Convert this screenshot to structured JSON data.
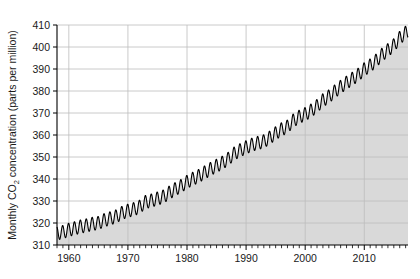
{
  "chart_data": {
    "type": "line",
    "title": "",
    "subtitle": "",
    "xlabel": "",
    "ylabel": "Monthly CO₂ concentration (parts per million)",
    "ylabel_parts": {
      "pre": "Monthly CO",
      "sub": "2",
      "post": " concentration (parts per million)"
    },
    "xlim": [
      1958.0,
      2017.4
    ],
    "ylim": [
      310,
      410
    ],
    "y_ticks": [
      310,
      320,
      330,
      340,
      350,
      360,
      370,
      380,
      390,
      400,
      410
    ],
    "y_tick_labels": [
      "310",
      "320",
      "330",
      "340",
      "350",
      "360",
      "370",
      "380",
      "390",
      "400",
      "410"
    ],
    "x_ticks": [
      1960,
      1970,
      1980,
      1990,
      2000,
      2010
    ],
    "x_tick_labels": [
      "1960",
      "1970",
      "1980",
      "1990",
      "2000",
      "2010"
    ],
    "x_minor_tick_interval": 1,
    "grid": {
      "horizontal": true,
      "vertical": true,
      "color": "#bdbdbd"
    },
    "legend": {
      "visible": false,
      "position": "none"
    },
    "series": [
      {
        "name": "Monthly mean CO₂",
        "line_color": "#000000",
        "line_width": 1.1,
        "fill_color": "#d9d9d9",
        "fill_below": true,
        "seasonal_amplitude_ppm": 3.0,
        "seasonal_period_years": 1.0,
        "annual_trend_points": [
          {
            "x": 1958.0,
            "y": 315.3
          },
          {
            "x": 1959.0,
            "y": 315.9
          },
          {
            "x": 1960.0,
            "y": 316.9
          },
          {
            "x": 1961.0,
            "y": 317.6
          },
          {
            "x": 1962.0,
            "y": 318.4
          },
          {
            "x": 1963.0,
            "y": 318.9
          },
          {
            "x": 1964.0,
            "y": 319.6
          },
          {
            "x": 1965.0,
            "y": 320.0
          },
          {
            "x": 1966.0,
            "y": 321.3
          },
          {
            "x": 1967.0,
            "y": 322.1
          },
          {
            "x": 1968.0,
            "y": 323.0
          },
          {
            "x": 1969.0,
            "y": 324.6
          },
          {
            "x": 1970.0,
            "y": 325.6
          },
          {
            "x": 1971.0,
            "y": 326.3
          },
          {
            "x": 1972.0,
            "y": 327.4
          },
          {
            "x": 1973.0,
            "y": 329.6
          },
          {
            "x": 1974.0,
            "y": 330.2
          },
          {
            "x": 1975.0,
            "y": 331.1
          },
          {
            "x": 1976.0,
            "y": 332.0
          },
          {
            "x": 1977.0,
            "y": 333.8
          },
          {
            "x": 1978.0,
            "y": 335.4
          },
          {
            "x": 1979.0,
            "y": 336.8
          },
          {
            "x": 1980.0,
            "y": 338.7
          },
          {
            "x": 1981.0,
            "y": 340.1
          },
          {
            "x": 1982.0,
            "y": 341.4
          },
          {
            "x": 1983.0,
            "y": 343.0
          },
          {
            "x": 1984.0,
            "y": 344.6
          },
          {
            "x": 1985.0,
            "y": 346.0
          },
          {
            "x": 1986.0,
            "y": 347.4
          },
          {
            "x": 1987.0,
            "y": 349.2
          },
          {
            "x": 1988.0,
            "y": 351.6
          },
          {
            "x": 1989.0,
            "y": 353.1
          },
          {
            "x": 1990.0,
            "y": 354.4
          },
          {
            "x": 1991.0,
            "y": 355.6
          },
          {
            "x": 1992.0,
            "y": 356.4
          },
          {
            "x": 1993.0,
            "y": 357.1
          },
          {
            "x": 1994.0,
            "y": 358.8
          },
          {
            "x": 1995.0,
            "y": 360.8
          },
          {
            "x": 1996.0,
            "y": 362.6
          },
          {
            "x": 1997.0,
            "y": 363.8
          },
          {
            "x": 1998.0,
            "y": 366.6
          },
          {
            "x": 1999.0,
            "y": 368.3
          },
          {
            "x": 2000.0,
            "y": 369.5
          },
          {
            "x": 2001.0,
            "y": 371.1
          },
          {
            "x": 2002.0,
            "y": 373.2
          },
          {
            "x": 2003.0,
            "y": 375.8
          },
          {
            "x": 2004.0,
            "y": 377.5
          },
          {
            "x": 2005.0,
            "y": 379.8
          },
          {
            "x": 2006.0,
            "y": 381.9
          },
          {
            "x": 2007.0,
            "y": 383.8
          },
          {
            "x": 2008.0,
            "y": 385.6
          },
          {
            "x": 2009.0,
            "y": 387.4
          },
          {
            "x": 2010.0,
            "y": 389.9
          },
          {
            "x": 2011.0,
            "y": 391.6
          },
          {
            "x": 2012.0,
            "y": 393.8
          },
          {
            "x": 2013.0,
            "y": 396.5
          },
          {
            "x": 2014.0,
            "y": 398.6
          },
          {
            "x": 2015.0,
            "y": 400.8
          },
          {
            "x": 2016.0,
            "y": 404.2
          },
          {
            "x": 2017.0,
            "y": 406.5
          },
          {
            "x": 2017.4,
            "y": 407.2
          }
        ]
      }
    ]
  },
  "plot_geometry": {
    "left": 57,
    "right": 408,
    "top": 25,
    "bottom": 245
  }
}
